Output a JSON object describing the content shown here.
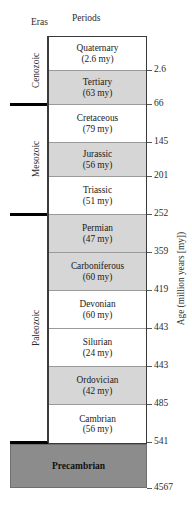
{
  "header": {
    "eras_label": "Eras",
    "periods_label": "Periods"
  },
  "axis": {
    "title": "Age (million years [my])",
    "unit": "my"
  },
  "chart_data": {
    "type": "table",
    "xlabel": "",
    "ylabel": "Age (million years [my])",
    "ylim": [
      0,
      4567
    ],
    "grid": false,
    "legend": "none",
    "eras": [
      {
        "name": "Cenozoic",
        "start_ma": 66,
        "end_ma": 0
      },
      {
        "name": "Mesozoic",
        "start_ma": 252,
        "end_ma": 66
      },
      {
        "name": "Paleozoic",
        "start_ma": 541,
        "end_ma": 252
      }
    ],
    "periods": [
      {
        "name": "Quaternary",
        "duration_label": "(2.6 my)",
        "duration_my": 2.6,
        "base_age": 2.6,
        "era": "Cenozoic",
        "fill": "white"
      },
      {
        "name": "Tertiary",
        "duration_label": "(63 my)",
        "duration_my": 63,
        "base_age": 66,
        "era": "Cenozoic",
        "fill": "gray"
      },
      {
        "name": "Cretaceous",
        "duration_label": "(79 my)",
        "duration_my": 79,
        "base_age": 145,
        "era": "Mesozoic",
        "fill": "white"
      },
      {
        "name": "Jurassic",
        "duration_label": "(56 my)",
        "duration_my": 56,
        "base_age": 201,
        "era": "Mesozoic",
        "fill": "gray"
      },
      {
        "name": "Triassic",
        "duration_label": "(51 my)",
        "duration_my": 51,
        "base_age": 252,
        "era": "Mesozoic",
        "fill": "white"
      },
      {
        "name": "Permian",
        "duration_label": "(47 my)",
        "duration_my": 47,
        "base_age": 359,
        "era": "Paleozoic",
        "fill": "gray"
      },
      {
        "name": "Carboniferous",
        "duration_label": "(60 my)",
        "duration_my": 60,
        "base_age": 419,
        "era": "Paleozoic",
        "fill": "gray"
      },
      {
        "name": "Devonian",
        "duration_label": "(60 my)",
        "duration_my": 60,
        "base_age": 443,
        "era": "Paleozoic",
        "fill": "white"
      },
      {
        "name": "Silurian",
        "duration_label": "(24 my)",
        "duration_my": 24,
        "base_age": 443,
        "era": "Paleozoic",
        "fill": "white"
      },
      {
        "name": "Ordovician",
        "duration_label": "(42 my)",
        "duration_my": 42,
        "base_age": 485,
        "era": "Paleozoic",
        "fill": "gray"
      },
      {
        "name": "Cambrian",
        "duration_label": "(56 my)",
        "duration_my": 56,
        "base_age": 541,
        "era": "Paleozoic",
        "fill": "white"
      }
    ],
    "precambrian": {
      "name": "Precambrian",
      "top_age": 541,
      "base_age": 4567,
      "fill": "#8c8c8c"
    },
    "tick_labels": [
      "2.6",
      "66",
      "145",
      "201",
      "252",
      "359",
      "419",
      "443",
      "443",
      "485",
      "541",
      "4567"
    ]
  },
  "colors": {
    "band_gray": "#d6d6d6",
    "band_white": "#ffffff",
    "precambrian_gray": "#8c8c8c",
    "era_line": "#000000",
    "box_border": "#3a3a3a",
    "text": "#1a1a1a"
  }
}
